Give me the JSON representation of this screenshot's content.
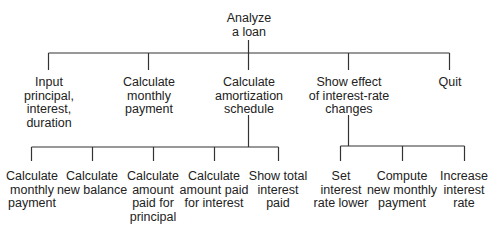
{
  "root": {
    "label": "Analyze\na loan"
  },
  "level1": [
    {
      "label": "Input\nprincipal,\ninterest,\nduration"
    },
    {
      "label": "Calculate\nmonthly\npayment"
    },
    {
      "label": "Calculate\namortization\nschedule"
    },
    {
      "label": "Show effect\nof interest-rate\nchanges"
    },
    {
      "label": "Quit"
    }
  ],
  "amortization_children": [
    {
      "label": "Calculate\nmonthly\npayment"
    },
    {
      "label": "Calculate\nnew balance"
    },
    {
      "label": "Calculate\namount\npaid for\nprincipal"
    },
    {
      "label": "Calculate\namount paid\nfor interest"
    },
    {
      "label": "Show total\ninterest\npaid"
    }
  ],
  "interest_rate_children": [
    {
      "label": "Set\ninterest\nrate lower"
    },
    {
      "label": "Compute\nnew monthly\npayment"
    },
    {
      "label": "Increase\ninterest\nrate"
    }
  ],
  "line_color": "#333333"
}
